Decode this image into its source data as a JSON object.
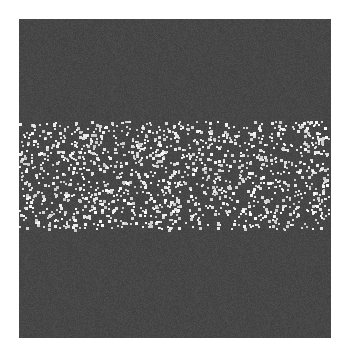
{
  "image": {
    "description": "Dark gray noisy square with a horizontal band of scattered white dots across its middle",
    "background_color": "#474747",
    "page_color": "#ffffff",
    "dot_color": "#f0f0f0",
    "band": {
      "orientation": "horizontal",
      "vertical_extent_fraction": [
        0.32,
        0.66
      ],
      "dot_count_approx": 1400
    }
  }
}
